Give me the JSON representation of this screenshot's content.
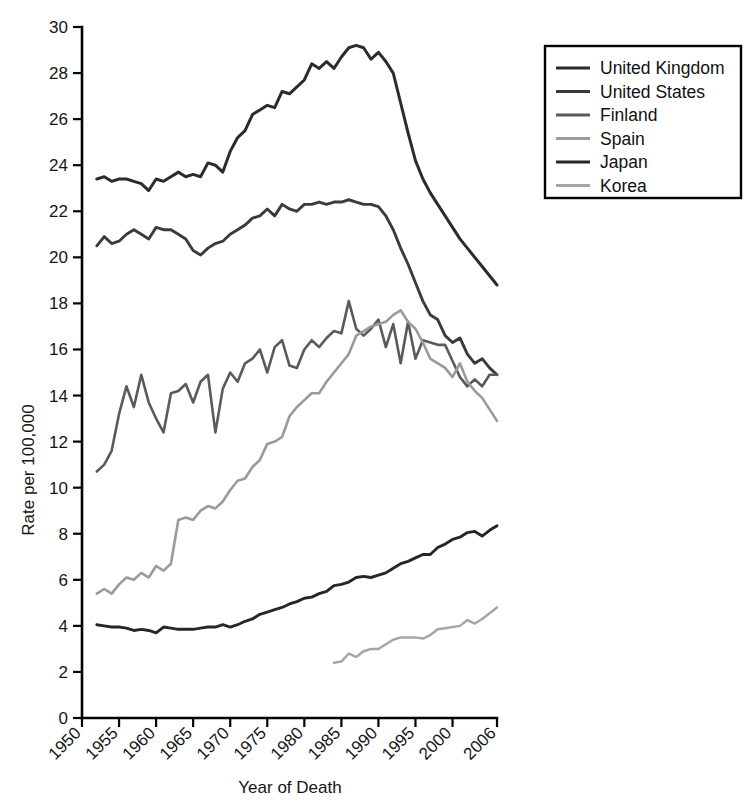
{
  "chart_data": {
    "type": "line",
    "title": "",
    "xlabel": "Year of Death",
    "ylabel": "Rate per 100,000",
    "xlim": [
      1950,
      2006
    ],
    "ylim": [
      0,
      30
    ],
    "xticks": [
      1950,
      1955,
      1960,
      1965,
      1970,
      1975,
      1980,
      1985,
      1990,
      1995,
      2000,
      2006
    ],
    "xtick_labels": [
      "1950",
      "1955",
      "1960",
      "1965",
      "1970",
      "1975",
      "1980",
      "1985",
      "1990",
      "1995",
      "2000",
      "2006"
    ],
    "yticks": [
      0,
      2,
      4,
      6,
      8,
      10,
      12,
      14,
      16,
      18,
      20,
      22,
      24,
      26,
      28,
      30
    ],
    "ytick_labels": [
      "0",
      "2",
      "4",
      "6",
      "8",
      "10",
      "12",
      "14",
      "16",
      "18",
      "20",
      "22",
      "24",
      "26",
      "28",
      "30"
    ],
    "grid": false,
    "legend_position": "right-top",
    "series": [
      {
        "name": "United Kingdom",
        "color": "#2b2b2b",
        "x": [
          1952,
          1953,
          1954,
          1955,
          1956,
          1957,
          1958,
          1959,
          1960,
          1961,
          1962,
          1963,
          1964,
          1965,
          1966,
          1967,
          1968,
          1969,
          1970,
          1971,
          1972,
          1973,
          1974,
          1975,
          1976,
          1977,
          1978,
          1979,
          1980,
          1981,
          1982,
          1983,
          1984,
          1985,
          1986,
          1987,
          1988,
          1989,
          1990,
          1991,
          1992,
          1993,
          1994,
          1995,
          1996,
          1997,
          1998,
          1999,
          2000,
          2001,
          2002,
          2003,
          2004,
          2005,
          2006
        ],
        "values": [
          23.4,
          23.5,
          23.3,
          23.4,
          23.4,
          23.3,
          23.2,
          22.9,
          23.4,
          23.3,
          23.5,
          23.7,
          23.5,
          23.6,
          23.5,
          24.1,
          24.0,
          23.7,
          24.6,
          25.2,
          25.5,
          26.2,
          26.4,
          26.6,
          26.5,
          27.2,
          27.1,
          27.4,
          27.7,
          28.4,
          28.2,
          28.5,
          28.2,
          28.7,
          29.1,
          29.2,
          29.1,
          28.6,
          28.9,
          28.5,
          28.0,
          26.7,
          25.4,
          24.2,
          23.4,
          22.8,
          22.3,
          21.8,
          21.3,
          20.8,
          20.4,
          20.0,
          19.6,
          19.2,
          18.8
        ]
      },
      {
        "name": "United States",
        "color": "#3b3b3b",
        "x": [
          1952,
          1953,
          1954,
          1955,
          1956,
          1957,
          1958,
          1959,
          1960,
          1961,
          1962,
          1963,
          1964,
          1965,
          1966,
          1967,
          1968,
          1969,
          1970,
          1971,
          1972,
          1973,
          1974,
          1975,
          1976,
          1977,
          1978,
          1979,
          1980,
          1981,
          1982,
          1983,
          1984,
          1985,
          1986,
          1987,
          1988,
          1989,
          1990,
          1991,
          1992,
          1993,
          1994,
          1995,
          1996,
          1997,
          1998,
          1999,
          2000,
          2001,
          2002,
          2003,
          2004,
          2005,
          2006
        ],
        "values": [
          20.5,
          20.9,
          20.6,
          20.7,
          21.0,
          21.2,
          21.0,
          20.8,
          21.3,
          21.2,
          21.2,
          21.0,
          20.8,
          20.3,
          20.1,
          20.4,
          20.6,
          20.7,
          21.0,
          21.2,
          21.4,
          21.7,
          21.8,
          22.1,
          21.8,
          22.3,
          22.1,
          22.0,
          22.3,
          22.3,
          22.4,
          22.3,
          22.4,
          22.4,
          22.5,
          22.4,
          22.3,
          22.3,
          22.2,
          21.8,
          21.2,
          20.4,
          19.7,
          18.9,
          18.1,
          17.5,
          17.3,
          16.6,
          16.3,
          16.5,
          15.8,
          15.4,
          15.6,
          15.2,
          14.9
        ]
      },
      {
        "name": "Finland",
        "color": "#5a5a5a",
        "x": [
          1952,
          1953,
          1954,
          1955,
          1956,
          1957,
          1958,
          1959,
          1960,
          1961,
          1962,
          1963,
          1964,
          1965,
          1966,
          1967,
          1968,
          1969,
          1970,
          1971,
          1972,
          1973,
          1974,
          1975,
          1976,
          1977,
          1978,
          1979,
          1980,
          1981,
          1982,
          1983,
          1984,
          1985,
          1986,
          1987,
          1988,
          1989,
          1990,
          1991,
          1992,
          1993,
          1994,
          1995,
          1996,
          1997,
          1998,
          1999,
          2000,
          2001,
          2002,
          2003,
          2004,
          2005,
          2006
        ],
        "values": [
          10.7,
          11.0,
          11.6,
          13.2,
          14.4,
          13.5,
          14.9,
          13.7,
          13.0,
          12.4,
          14.1,
          14.2,
          14.5,
          13.7,
          14.6,
          14.9,
          12.4,
          14.3,
          15.0,
          14.6,
          15.4,
          15.6,
          16.0,
          15.0,
          16.1,
          16.4,
          15.3,
          15.2,
          16.0,
          16.4,
          16.1,
          16.5,
          16.8,
          16.7,
          18.1,
          16.9,
          16.6,
          16.9,
          17.3,
          16.1,
          17.1,
          15.4,
          17.2,
          15.6,
          16.4,
          16.3,
          16.2,
          16.2,
          15.5,
          14.8,
          14.4,
          14.7,
          14.4,
          14.9,
          14.9
        ]
      },
      {
        "name": "Spain",
        "color": "#9a9a9a",
        "x": [
          1952,
          1953,
          1954,
          1955,
          1956,
          1957,
          1958,
          1959,
          1960,
          1961,
          1962,
          1963,
          1964,
          1965,
          1966,
          1967,
          1968,
          1969,
          1970,
          1971,
          1972,
          1973,
          1974,
          1975,
          1976,
          1977,
          1978,
          1979,
          1980,
          1981,
          1982,
          1983,
          1984,
          1985,
          1986,
          1987,
          1988,
          1989,
          1990,
          1991,
          1992,
          1993,
          1994,
          1995,
          1996,
          1997,
          1998,
          1999,
          2000,
          2001,
          2002,
          2003,
          2004,
          2005,
          2006
        ],
        "values": [
          5.4,
          5.6,
          5.4,
          5.8,
          6.1,
          6.0,
          6.3,
          6.1,
          6.6,
          6.4,
          6.7,
          8.6,
          8.7,
          8.6,
          9.0,
          9.2,
          9.1,
          9.4,
          9.9,
          10.3,
          10.4,
          10.9,
          11.2,
          11.9,
          12.0,
          12.2,
          13.1,
          13.5,
          13.8,
          14.1,
          14.1,
          14.6,
          15.0,
          15.4,
          15.8,
          16.6,
          16.8,
          17.0,
          17.1,
          17.2,
          17.5,
          17.7,
          17.2,
          16.9,
          16.3,
          15.6,
          15.4,
          15.2,
          14.8,
          15.4,
          14.6,
          14.2,
          13.9,
          13.4,
          12.9
        ]
      },
      {
        "name": "Japan",
        "color": "#262626",
        "x": [
          1952,
          1953,
          1954,
          1955,
          1956,
          1957,
          1958,
          1959,
          1960,
          1961,
          1962,
          1963,
          1964,
          1965,
          1966,
          1967,
          1968,
          1969,
          1970,
          1971,
          1972,
          1973,
          1974,
          1975,
          1976,
          1977,
          1978,
          1979,
          1980,
          1981,
          1982,
          1983,
          1984,
          1985,
          1986,
          1987,
          1988,
          1989,
          1990,
          1991,
          1992,
          1993,
          1994,
          1995,
          1996,
          1997,
          1998,
          1999,
          2000,
          2001,
          2002,
          2003,
          2004,
          2005,
          2006
        ],
        "values": [
          4.05,
          4.0,
          3.95,
          3.95,
          3.9,
          3.8,
          3.85,
          3.8,
          3.7,
          3.95,
          3.9,
          3.85,
          3.85,
          3.85,
          3.9,
          3.95,
          3.95,
          4.05,
          3.95,
          4.05,
          4.2,
          4.3,
          4.5,
          4.6,
          4.7,
          4.8,
          4.95,
          5.05,
          5.2,
          5.25,
          5.4,
          5.5,
          5.75,
          5.8,
          5.9,
          6.1,
          6.15,
          6.1,
          6.2,
          6.3,
          6.5,
          6.7,
          6.8,
          6.95,
          7.1,
          7.1,
          7.4,
          7.55,
          7.75,
          7.85,
          8.05,
          8.1,
          7.9,
          8.15,
          8.35
        ]
      },
      {
        "name": "Korea",
        "color": "#a6a6a6",
        "x": [
          1984,
          1985,
          1986,
          1987,
          1988,
          1989,
          1990,
          1991,
          1992,
          1993,
          1994,
          1995,
          1996,
          1997,
          1998,
          1999,
          2000,
          2001,
          2002,
          2003,
          2004,
          2005,
          2006
        ],
        "values": [
          2.4,
          2.45,
          2.8,
          2.65,
          2.9,
          3.0,
          3.0,
          3.2,
          3.4,
          3.5,
          3.5,
          3.5,
          3.45,
          3.6,
          3.85,
          3.9,
          3.95,
          4.0,
          4.25,
          4.1,
          4.3,
          4.55,
          4.8
        ]
      }
    ]
  },
  "legend": {
    "items": [
      {
        "label": "United Kingdom",
        "color": "#2b2b2b"
      },
      {
        "label": "United States",
        "color": "#3b3b3b"
      },
      {
        "label": "Finland",
        "color": "#5a5a5a"
      },
      {
        "label": "Spain",
        "color": "#9a9a9a"
      },
      {
        "label": "Japan",
        "color": "#262626"
      },
      {
        "label": "Korea",
        "color": "#a6a6a6"
      }
    ]
  },
  "axes": {
    "x_title": "Year of Death",
    "y_title": "Rate per 100,000"
  }
}
